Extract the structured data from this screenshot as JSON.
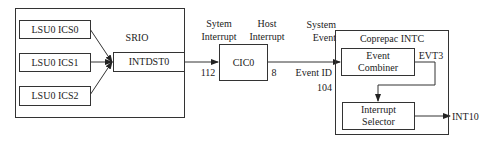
{
  "diagram": {
    "srio": {
      "title": "SRIO",
      "sources": [
        {
          "label": "LSU0 ICS0"
        },
        {
          "label": "LSU0 ICS1"
        },
        {
          "label": "LSU0 ICS2"
        }
      ],
      "destination": "INTDST0"
    },
    "link_srio_cic": {
      "top_label_line1": "Sytem",
      "top_label_line2": "Interrupt",
      "number": "112"
    },
    "cic": {
      "label": "CIC0",
      "out_label_line1": "Host",
      "out_label_line2": "Interrupt",
      "out_number": "8"
    },
    "link_cic_intc": {
      "top_label_line1": "System",
      "top_label_line2": "Event",
      "bottom_label_line1": "Event ID",
      "bottom_label_line2": "104"
    },
    "intc": {
      "title": "Coprepac INTC",
      "event_combiner_line1": "Event",
      "event_combiner_line2": "Combiner",
      "evt_label": "EVT3",
      "interrupt_selector_line1": "Interrupt",
      "interrupt_selector_line2": "Selector",
      "output": "INT10"
    },
    "colors": {
      "line": "#333333",
      "text": "#222222",
      "background": "#ffffff"
    }
  }
}
